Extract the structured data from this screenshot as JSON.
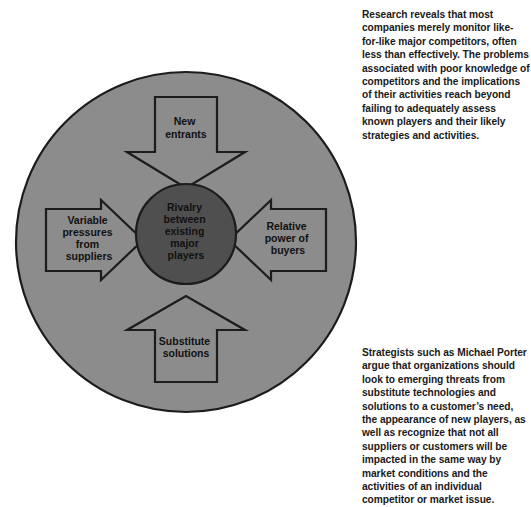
{
  "diagram": {
    "outer_circle": {
      "name": "competitive-environment-circle",
      "fill": "#8c8c8c",
      "stroke": "#1c1c1c",
      "center_x": 186,
      "center_y": 242,
      "radius": 170
    },
    "center_circle": {
      "name": "rivalry-core",
      "fill": "#4f4f4f",
      "stroke": "#1c1c1c",
      "center_x": 186,
      "center_y": 234,
      "radius": 50,
      "label_lines": [
        "Rivalry",
        "between",
        "existing",
        "major",
        "players"
      ]
    },
    "arrows": [
      {
        "id": "new-entrants",
        "direction": "down",
        "fill": "#8c8c8c",
        "stroke": "#1c1c1c",
        "label_lines": [
          "New",
          "entrants"
        ]
      },
      {
        "id": "supplier-pressure",
        "direction": "right",
        "fill": "#8c8c8c",
        "stroke": "#1c1c1c",
        "label_lines": [
          "Variable",
          "pressures",
          "from",
          "suppliers"
        ]
      },
      {
        "id": "buyer-power",
        "direction": "left",
        "fill": "#8c8c8c",
        "stroke": "#1c1c1c",
        "label_lines": [
          "Relative",
          "power of",
          "buyers"
        ]
      },
      {
        "id": "substitute-solutions",
        "direction": "up",
        "fill": "#8c8c8c",
        "stroke": "#1c1c1c",
        "label_lines": [
          "Substitute",
          "solutions"
        ]
      }
    ]
  },
  "notes": {
    "top": "Research reveals that most companies merely monitor like-for-like major competitors, often less than effectively. The problems associated with poor knowledge of competitors and the implications of their activities reach beyond failing to adequately assess known players and their likely strategies and activities.",
    "bottom": "Strategists such as Michael Porter argue that organizations should look to emerging threats from substitute technologies and solutions to a customer’s need, the appearance of new players, as well as recognize that not all suppliers or customers will be impacted in the same way by market conditions and the activities of an individual competitor or market issue."
  },
  "colors": {
    "background": "#ffffff",
    "outer_gray": "#8c8c8c",
    "core_gray": "#4f4f4f",
    "outline": "#1c1c1c",
    "text": "#1a1a1a"
  }
}
